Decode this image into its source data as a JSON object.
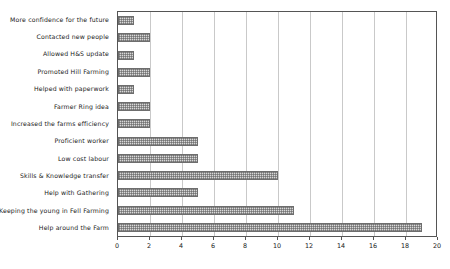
{
  "chart_data": {
    "type": "bar",
    "orientation": "horizontal",
    "title": "",
    "xlabel": "",
    "ylabel": "",
    "xlim": [
      0,
      20
    ],
    "xticks": [
      0,
      2,
      4,
      6,
      8,
      10,
      12,
      14,
      16,
      18,
      20
    ],
    "grid": true,
    "legend": "none",
    "bar_fill_color": "#d8d8d8",
    "bar_border_color": "#6e6e6e",
    "bar_pattern": "cross-hatch-dots",
    "categories": [
      "More confidence for the future",
      "Contacted new people",
      "Allowed H&S update",
      "Promoted Hill Farming",
      "Helped with paperwork",
      "Farmer Ring idea",
      "Increased the farms efficiency",
      "Proficient worker",
      "Low cost labour",
      "Skills & Knowledge transfer",
      "Help with Gathering",
      "Keeping the young in Fell Farming",
      "Help around the Farm"
    ],
    "values": [
      1,
      2,
      1,
      2,
      1,
      2,
      2,
      5,
      5,
      10,
      5,
      11,
      19
    ]
  }
}
